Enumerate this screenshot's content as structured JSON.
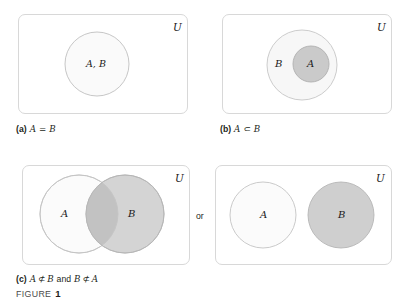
{
  "figure": {
    "label_word": "FIGURE",
    "label_number": "1",
    "connector": "or"
  },
  "panels": [
    {
      "id": "panel-a",
      "caption_tag": "(a)",
      "caption_math_left": "A",
      "caption_operator": "=",
      "caption_math_right": "B",
      "universe_label": "U",
      "circles": [
        {
          "name": "circle-ab",
          "label": "A, B",
          "fill": "#fafafa",
          "stroke": "#bfbfbf"
        }
      ]
    },
    {
      "id": "panel-b",
      "caption_tag": "(b)",
      "caption_math_left": "A",
      "caption_operator": "⊂",
      "caption_math_right": "B",
      "universe_label": "U",
      "circles": [
        {
          "name": "circle-b",
          "label": "B",
          "fill": "#f7f7f7",
          "stroke": "#c6c6c6"
        },
        {
          "name": "circle-a",
          "label": "A",
          "fill": "#cacaca",
          "stroke": "#b0b0b0"
        }
      ]
    },
    {
      "id": "panel-c-overlap",
      "caption_tag": "(c)",
      "caption_text_full": "A ⊄ B and B ⊄ A",
      "caption_math_a": "A",
      "caption_op_1": "⊄",
      "caption_math_b": "B",
      "caption_word_and": "and",
      "caption_math_b2": "B",
      "caption_op_2": "⊄",
      "caption_math_a2": "A",
      "universe_label": "U",
      "circles": [
        {
          "name": "circle-a",
          "label": "A",
          "fill": "#fbfbfb",
          "stroke": "#c4c4c4"
        },
        {
          "name": "circle-b",
          "label": "B",
          "fill": "#d4d4d4",
          "stroke": "#b6b6b6"
        }
      ]
    },
    {
      "id": "panel-c-disjoint",
      "caption_tag": "",
      "universe_label": "U",
      "circles": [
        {
          "name": "circle-a",
          "label": "A",
          "fill": "#fbfbfb",
          "stroke": "#c4c4c4"
        },
        {
          "name": "circle-b",
          "label": "B",
          "fill": "#cfcfcf",
          "stroke": "#b6b6b6"
        }
      ]
    }
  ],
  "colors": {
    "box_stroke": "#d8d8d8",
    "page_background": "#ffffff",
    "light_fill": "#fafafa",
    "mid_fill": "#cacaca",
    "dark_fill": "#cfcfcf",
    "overlap_fill": "#c2c2c2",
    "text": "#231f20"
  }
}
